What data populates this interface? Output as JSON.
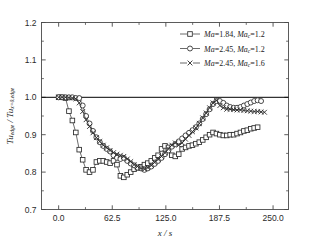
{
  "chart_data": {
    "type": "line",
    "title": "",
    "xlabel": "x / s",
    "ylabel": "Tu_edge / Tu_x=0,edge",
    "xlim": [
      -20,
      268
    ],
    "ylim": [
      0.7,
      1.2
    ],
    "xticks": [
      "0.0",
      "62.5",
      "125.0",
      "187.5",
      "250.0"
    ],
    "xtick_values": [
      0,
      62.5,
      125,
      187.5,
      250
    ],
    "yticks": [
      "0.7",
      "0.8",
      "0.9",
      "1.0",
      "1.1",
      "1.2"
    ],
    "ytick_values": [
      0.7,
      0.8,
      0.9,
      1.0,
      1.1,
      1.2
    ],
    "minor_yticks": [
      0.75,
      0.85,
      0.95,
      1.05,
      1.15
    ],
    "minor_xticks": [
      31.25,
      93.75,
      156.25,
      218.75
    ],
    "grid": false,
    "reference_line": {
      "y": 1.0,
      "style": "solid",
      "color": "#000000"
    },
    "legend_position": "top-right",
    "line_color": "#3a3a3a",
    "series": [
      {
        "name": "Ma=1.84, Mac=1.2",
        "marker": "square",
        "label_prefix": "Ma",
        "label_value": "1.84",
        "label_sub": "c",
        "label_value2": "1.2",
        "x": [
          0,
          4,
          8,
          12,
          16,
          20,
          24,
          28,
          32,
          36,
          40,
          44,
          48,
          52,
          56,
          60,
          64,
          68,
          72,
          76,
          80,
          84,
          88,
          92,
          96,
          100,
          104,
          108,
          112,
          116,
          120,
          124,
          128,
          132,
          136,
          140,
          144,
          148,
          152,
          156,
          160,
          164,
          168,
          172,
          176,
          180,
          184,
          188,
          192,
          196,
          200,
          204,
          208,
          212,
          216,
          220,
          224,
          228,
          232
        ],
        "y": [
          1.0,
          1.0,
          0.998,
          0.963,
          0.938,
          0.906,
          0.86,
          0.833,
          0.806,
          0.8,
          0.806,
          0.827,
          0.83,
          0.83,
          0.827,
          0.824,
          0.83,
          0.82,
          0.79,
          0.786,
          0.793,
          0.8,
          0.808,
          0.812,
          0.814,
          0.82,
          0.824,
          0.83,
          0.838,
          0.845,
          0.862,
          0.87,
          0.866,
          0.845,
          0.842,
          0.848,
          0.862,
          0.866,
          0.87,
          0.872,
          0.876,
          0.88,
          0.886,
          0.893,
          0.9,
          0.906,
          0.903,
          0.9,
          0.898,
          0.898,
          0.9,
          0.9,
          0.903,
          0.906,
          0.91,
          0.912,
          0.916,
          0.918,
          0.92
        ]
      },
      {
        "name": "Ma=2.45, Mac=1.2",
        "marker": "circle",
        "label_prefix": "Ma",
        "label_value": "2.45",
        "label_sub": "c",
        "label_value2": "1.2",
        "x": [
          0,
          4,
          8,
          12,
          16,
          20,
          24,
          28,
          32,
          36,
          40,
          44,
          48,
          52,
          56,
          60,
          64,
          68,
          72,
          76,
          80,
          84,
          88,
          92,
          96,
          100,
          104,
          108,
          112,
          116,
          120,
          124,
          128,
          132,
          136,
          140,
          144,
          148,
          152,
          156,
          160,
          164,
          168,
          172,
          176,
          180,
          184,
          188,
          192,
          196,
          200,
          204,
          208,
          212,
          216,
          220,
          224,
          228,
          232,
          236
        ],
        "y": [
          1.0,
          1.0,
          1.0,
          1.0,
          1.0,
          0.998,
          0.998,
          0.978,
          0.95,
          0.93,
          0.91,
          0.893,
          0.88,
          0.87,
          0.862,
          0.855,
          0.845,
          0.838,
          0.835,
          0.838,
          0.83,
          0.823,
          0.818,
          0.812,
          0.81,
          0.806,
          0.81,
          0.815,
          0.822,
          0.83,
          0.838,
          0.848,
          0.858,
          0.868,
          0.875,
          0.882,
          0.89,
          0.898,
          0.905,
          0.912,
          0.92,
          0.93,
          0.942,
          0.955,
          0.968,
          0.982,
          0.99,
          0.99,
          0.985,
          0.978,
          0.974,
          0.972,
          0.972,
          0.974,
          0.978,
          0.982,
          0.986,
          0.99,
          0.992,
          0.99
        ]
      },
      {
        "name": "Ma=2.45, Mac=1.6",
        "marker": "cross",
        "label_prefix": "Ma",
        "label_value": "2.45",
        "label_sub": "c",
        "label_value2": "1.6",
        "x": [
          0,
          4,
          8,
          12,
          16,
          20,
          24,
          28,
          32,
          36,
          40,
          44,
          48,
          52,
          56,
          60,
          64,
          68,
          72,
          76,
          80,
          84,
          88,
          92,
          96,
          100,
          104,
          108,
          112,
          116,
          120,
          124,
          128,
          132,
          136,
          140,
          144,
          148,
          152,
          156,
          160,
          164,
          168,
          172,
          176,
          180,
          184,
          188,
          192,
          196,
          200,
          204,
          208,
          212,
          216,
          220,
          224,
          228,
          232,
          236,
          240
        ],
        "y": [
          1.0,
          1.0,
          1.0,
          0.999,
          0.998,
          0.996,
          0.985,
          0.962,
          0.94,
          0.922,
          0.905,
          0.892,
          0.882,
          0.872,
          0.865,
          0.858,
          0.852,
          0.848,
          0.845,
          0.842,
          0.835,
          0.828,
          0.82,
          0.815,
          0.81,
          0.808,
          0.812,
          0.818,
          0.826,
          0.834,
          0.842,
          0.852,
          0.862,
          0.872,
          0.878,
          0.872,
          0.878,
          0.888,
          0.898,
          0.908,
          0.918,
          0.93,
          0.945,
          0.958,
          0.972,
          0.985,
          0.992,
          0.978,
          0.972,
          0.968,
          0.968,
          0.967,
          0.966,
          0.966,
          0.965,
          0.964,
          0.963,
          0.962,
          0.962,
          0.961,
          0.96
        ]
      }
    ]
  }
}
